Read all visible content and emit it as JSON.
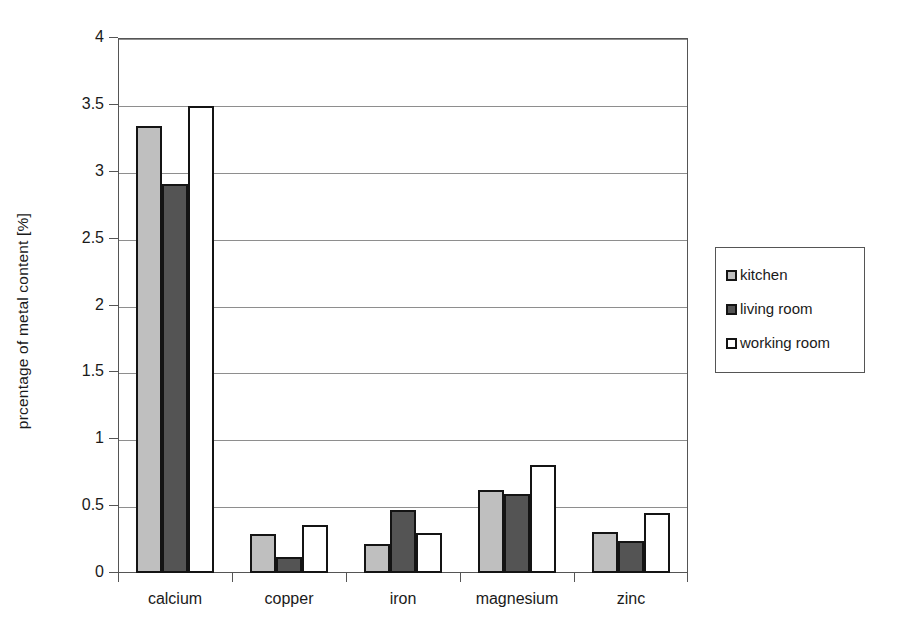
{
  "chart_data": {
    "type": "bar",
    "title": "",
    "xlabel": "",
    "ylabel": "prcentage of metal content [%]",
    "categories": [
      "calcium",
      "copper",
      "iron",
      "magnesium",
      "zinc"
    ],
    "series": [
      {
        "name": "kitchen",
        "color": "#bfbfbf",
        "values": [
          3.34,
          0.29,
          0.22,
          0.62,
          0.31
        ]
      },
      {
        "name": "living room",
        "color": "#545454",
        "values": [
          2.91,
          0.12,
          0.47,
          0.59,
          0.24
        ]
      },
      {
        "name": "working room",
        "color": "#ffffff",
        "values": [
          3.49,
          0.36,
          0.3,
          0.81,
          0.45
        ]
      }
    ],
    "ylim": [
      0,
      4
    ],
    "ytick_values": [
      0,
      0.5,
      1,
      1.5,
      2,
      2.5,
      3,
      3.5,
      4
    ],
    "ytick_labels": [
      "0",
      "0.5",
      "1",
      "1.5",
      "2",
      "2.5",
      "3",
      "3.5",
      "4"
    ],
    "grid": "horizontal",
    "legend_position": "right",
    "bar_outline_color": "#141414",
    "axis_color": "#555555",
    "gridline_color": "#8e8e8e",
    "background": "#ffffff"
  },
  "legend": {
    "items": [
      {
        "label": "kitchen"
      },
      {
        "label": "living room"
      },
      {
        "label": "working room"
      }
    ]
  }
}
